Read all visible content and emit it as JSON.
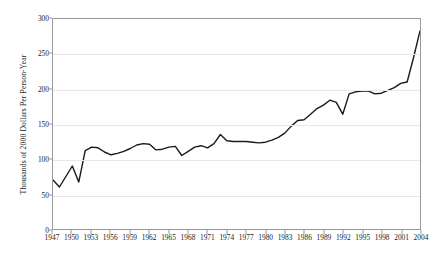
{
  "chart_data": {
    "type": "line",
    "title": "",
    "xlabel": "",
    "ylabel": "Thousands of 2000 Dollars Per Person-Year",
    "xlim": [
      1947,
      2004
    ],
    "ylim": [
      0,
      300
    ],
    "yticks": [
      0,
      50,
      100,
      150,
      200,
      250,
      300
    ],
    "ytick_labels": [
      "0",
      "50",
      "100",
      "150",
      "200",
      "250",
      "300"
    ],
    "xticks": [
      1947,
      1950,
      1953,
      1956,
      1959,
      1962,
      1965,
      1968,
      1971,
      1974,
      1977,
      1980,
      1983,
      1986,
      1989,
      1992,
      1995,
      1998,
      2001,
      2004
    ],
    "xtick_labels": [
      "1947",
      "1950",
      "1953",
      "1956",
      "1959",
      "1962",
      "1965",
      "1968",
      "1971",
      "1974",
      "1977",
      "1980",
      "1983",
      "1986",
      "1989",
      "1992",
      "1995",
      "1998",
      "2001",
      "2004"
    ],
    "grid": "horizontal",
    "grid_color": "#e8e8e8",
    "legend": "none",
    "line_color": "#1a1a1a",
    "line_width": 1.4,
    "series": [
      {
        "name": "Value",
        "x": [
          1947,
          1948,
          1949,
          1950,
          1951,
          1952,
          1953,
          1954,
          1955,
          1956,
          1957,
          1958,
          1959,
          1960,
          1961,
          1962,
          1963,
          1964,
          1965,
          1966,
          1967,
          1968,
          1969,
          1970,
          1971,
          1972,
          1973,
          1974,
          1975,
          1976,
          1977,
          1978,
          1979,
          1980,
          1981,
          1982,
          1983,
          1984,
          1985,
          1986,
          1987,
          1988,
          1989,
          1990,
          1991,
          1992,
          1993,
          1994,
          1995,
          1996,
          1997,
          1998,
          1999,
          2000,
          2001,
          2002,
          2003,
          2004
        ],
        "values": [
          70,
          60,
          75,
          90,
          67,
          112,
          117,
          116,
          110,
          106,
          108,
          111,
          115,
          120,
          122,
          121,
          113,
          114,
          117,
          118,
          105,
          111,
          117,
          119,
          116,
          122,
          135,
          126,
          125,
          125,
          125,
          124,
          123,
          124,
          127,
          131,
          137,
          147,
          155,
          156,
          164,
          172,
          177,
          184,
          181,
          164,
          193,
          196,
          197,
          197,
          193,
          194,
          198,
          202,
          208,
          210,
          245,
          283
        ]
      }
    ]
  }
}
